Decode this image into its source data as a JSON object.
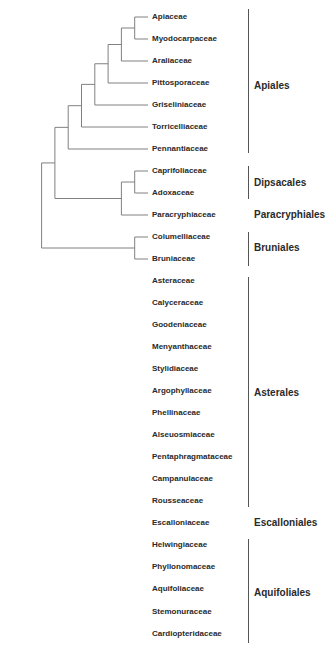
{
  "diagram": {
    "type": "phylogenetic-tree",
    "line_color": "#808080",
    "text_color": "#2a2a2a",
    "leaves": [
      {
        "name": "Apiaceae",
        "y": 17
      },
      {
        "name": "Myodocarpaceae",
        "y": 39
      },
      {
        "name": "Araliaceae",
        "y": 61
      },
      {
        "name": "Pittosporaceae",
        "y": 83
      },
      {
        "name": "Griseliniaceae",
        "y": 105
      },
      {
        "name": "Torricelliaceae",
        "y": 127
      },
      {
        "name": "Pennantiaceae",
        "y": 149
      },
      {
        "name": "Caprifoliaceae",
        "y": 171
      },
      {
        "name": "Adoxaceae",
        "y": 193
      },
      {
        "name": "Paracryphiaceae",
        "y": 215
      },
      {
        "name": "Columelliaceae",
        "y": 237
      },
      {
        "name": "Bruniaceae",
        "y": 259
      },
      {
        "name": "Asteraceae",
        "y": 281
      },
      {
        "name": "Calyceraceae",
        "y": 303
      },
      {
        "name": "Goodeniaceae",
        "y": 325
      },
      {
        "name": "Menyanthaceae",
        "y": 347
      },
      {
        "name": "Stylidiaceae",
        "y": 369
      },
      {
        "name": "Argophyllaceae",
        "y": 391
      },
      {
        "name": "Phellinaceae",
        "y": 413
      },
      {
        "name": "Alseuosmiaceae",
        "y": 435
      },
      {
        "name": "Pentaphragmataceae",
        "y": 457
      },
      {
        "name": "Campanulaceae",
        "y": 479
      },
      {
        "name": "Rousseaceae",
        "y": 501
      },
      {
        "name": "Escalloniaceae",
        "y": 523
      },
      {
        "name": "Helwingiaceae",
        "y": 545
      },
      {
        "name": "Phyllonomaceae",
        "y": 567
      },
      {
        "name": "Aquifoliaceae",
        "y": 589
      },
      {
        "name": "Stemonuraceae",
        "y": 612
      },
      {
        "name": "Cardiopteridaceae",
        "y": 634
      }
    ],
    "orders": [
      {
        "name": "Apiales",
        "label_y": 86,
        "bracket": [
          9,
          153
        ]
      },
      {
        "name": "Dipsacales",
        "label_y": 183,
        "bracket": [
          166,
          199
        ]
      },
      {
        "name": "Paracryphiales",
        "label_y": 215,
        "bracket": null
      },
      {
        "name": "Bruniales",
        "label_y": 248,
        "bracket": [
          232,
          266
        ]
      },
      {
        "name": "Asterales",
        "label_y": 393,
        "bracket": [
          277,
          507
        ]
      },
      {
        "name": "Escalloniales",
        "label_y": 523,
        "bracket": null
      },
      {
        "name": "Aquifoliales",
        "label_y": 593,
        "bracket": [
          539,
          643
        ]
      }
    ],
    "newick": "((((((((Apiaceae,Myodocarpaceae),Araliaceae),Pittosporaceae),Griseliniaceae),Torricelliaceae),Pennantiaceae),((Caprifoliaceae,Adoxaceae),Paracryphiaceae)),(Columelliaceae,Bruniaceae)),((((((Asteraceae,Calyceraceae),Goodeniaceae),Menyanthaceae),Stylidiaceae),((Argophyllaceae,Phellinaceae),Alseuosmiaceae)),Pentaphragmataceae),(Campanulaceae,Rousseaceae)),Escalloniaceae),(((Helwingiaceae,Phyllonomaceae),Aquifoliaceae),(Stemonuraceae,Cardiopteridaceae)));"
  }
}
